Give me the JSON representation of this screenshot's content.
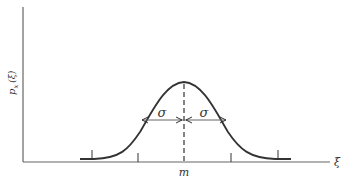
{
  "figure": {
    "ylabel": "p",
    "ylabel_sub": "x",
    "ylabel_arg": "(ξ)",
    "xlabel": "ξ",
    "mean_label": "m",
    "sigma_left": "σ",
    "sigma_right": "σ"
  },
  "colors": {
    "ink": "#333333",
    "axis": "#555555",
    "background": "#ffffff"
  }
}
